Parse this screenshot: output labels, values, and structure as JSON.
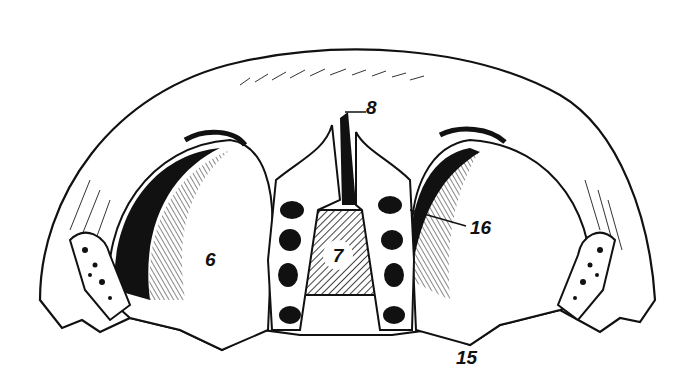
{
  "figure": {
    "style": "black-and-white anatomical line engraving",
    "colors": {
      "ink": "#111111",
      "paper": "#ffffff"
    },
    "labels": [
      {
        "id": "6",
        "text": "6",
        "x": 205,
        "y": 250
      },
      {
        "id": "7",
        "text": "7",
        "x": 336,
        "y": 246
      },
      {
        "id": "8",
        "text": "8",
        "x": 366,
        "y": 98
      },
      {
        "id": "15",
        "text": "15",
        "x": 456,
        "y": 348
      },
      {
        "id": "16",
        "text": "16",
        "x": 470,
        "y": 218
      }
    ]
  }
}
